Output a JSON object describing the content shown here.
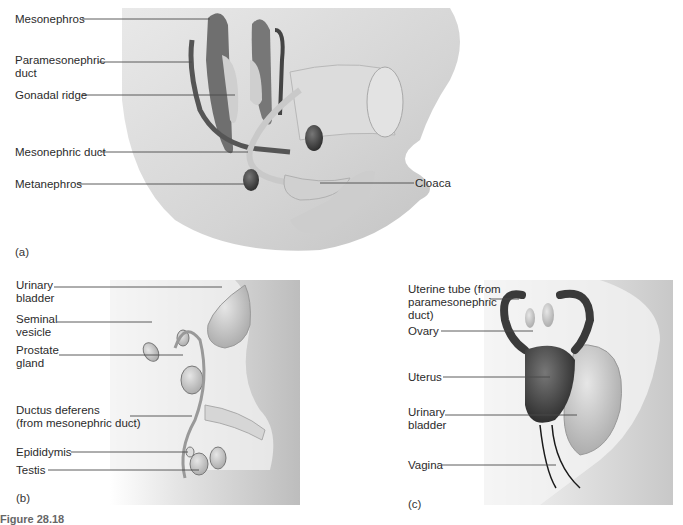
{
  "figure": {
    "caption_partial": "Figure 28.18",
    "panels": [
      {
        "id": "a",
        "tag": "(a)",
        "labels": {
          "mesonephros": "Mesonephros",
          "paramesonephric_duct_1": "Paramesonephric",
          "paramesonephric_duct_2": "duct",
          "gonadal_ridge": "Gonadal ridge",
          "mesonephric_duct": "Mesonephric duct",
          "metanephros": "Metanephros",
          "cloaca": "Cloaca"
        }
      },
      {
        "id": "b",
        "tag": "(b)",
        "labels": {
          "urinary_bladder_1": "Urinary",
          "urinary_bladder_2": "bladder",
          "seminal_vesicle_1": "Seminal",
          "seminal_vesicle_2": "vesicle",
          "prostate_gland_1": "Prostate",
          "prostate_gland_2": "gland",
          "ductus_deferens_1": "Ductus deferens",
          "ductus_deferens_2": "(from mesonephric duct)",
          "epididymis": "Epididymis",
          "testis": "Testis"
        }
      },
      {
        "id": "c",
        "tag": "(c)",
        "labels": {
          "uterine_tube_1": "Uterine tube (from",
          "uterine_tube_2": "paramesonephric",
          "uterine_tube_3": "duct)",
          "ovary": "Ovary",
          "uterus": "Uterus",
          "urinary_bladder_1": "Urinary",
          "urinary_bladder_2": "bladder",
          "vagina": "Vagina"
        }
      }
    ]
  }
}
